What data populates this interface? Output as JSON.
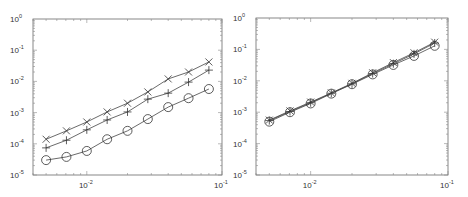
{
  "chart_data": [
    {
      "type": "line",
      "title": "",
      "xlabel": "",
      "ylabel": "",
      "xscale": "log",
      "yscale": "log",
      "xlim": [
        0.004,
        0.1
      ],
      "ylim": [
        1e-05,
        1
      ],
      "grid": false,
      "legend": null,
      "x_ticks": [
        {
          "base": "10",
          "exp": "-2",
          "value": 0.01
        },
        {
          "base": "10",
          "exp": "-1",
          "value": 0.1
        }
      ],
      "y_ticks": [
        {
          "base": "10",
          "exp": "0",
          "value": 1
        },
        {
          "base": "10",
          "exp": "-1",
          "value": 0.1
        },
        {
          "base": "10",
          "exp": "-2",
          "value": 0.01
        },
        {
          "base": "10",
          "exp": "-3",
          "value": 0.001
        },
        {
          "base": "10",
          "exp": "-4",
          "value": 0.0001
        },
        {
          "base": "10",
          "exp": "-5",
          "value": 1e-05
        }
      ],
      "x": [
        0.005,
        0.00707,
        0.01,
        0.01414,
        0.02,
        0.02828,
        0.04,
        0.05657,
        0.08
      ],
      "series": [
        {
          "name": "x-marker",
          "marker": "x",
          "values": [
            0.00014,
            0.00026,
            0.0005,
            0.00105,
            0.002,
            0.0046,
            0.012,
            0.02,
            0.042
          ]
        },
        {
          "name": "plus-marker",
          "marker": "+",
          "values": [
            7.4e-05,
            0.00013,
            0.00028,
            0.00058,
            0.00105,
            0.0027,
            0.0042,
            0.0095,
            0.023
          ]
        },
        {
          "name": "circle-marker",
          "marker": "o",
          "values": [
            3e-05,
            3.8e-05,
            5.9e-05,
            0.00014,
            0.00026,
            0.00062,
            0.0015,
            0.0029,
            0.0057
          ]
        }
      ]
    },
    {
      "type": "line",
      "title": "",
      "xlabel": "",
      "ylabel": "",
      "xscale": "log",
      "yscale": "log",
      "xlim": [
        0.004,
        0.1
      ],
      "ylim": [
        1e-05,
        1
      ],
      "grid": false,
      "legend": null,
      "x_ticks": [
        {
          "base": "10",
          "exp": "-2",
          "value": 0.01
        },
        {
          "base": "10",
          "exp": "-1",
          "value": 0.1
        }
      ],
      "y_ticks": [
        {
          "base": "10",
          "exp": "0",
          "value": 1
        },
        {
          "base": "10",
          "exp": "-1",
          "value": 0.1
        },
        {
          "base": "10",
          "exp": "-2",
          "value": 0.01
        },
        {
          "base": "10",
          "exp": "-3",
          "value": 0.001
        },
        {
          "base": "10",
          "exp": "-4",
          "value": 0.0001
        },
        {
          "base": "10",
          "exp": "-5",
          "value": 1e-05
        }
      ],
      "x": [
        0.005,
        0.00707,
        0.01,
        0.01414,
        0.02,
        0.02828,
        0.04,
        0.05657,
        0.08
      ],
      "series": [
        {
          "name": "x-marker",
          "marker": "x",
          "values": [
            0.00056,
            0.0011,
            0.0021,
            0.0041,
            0.0083,
            0.018,
            0.038,
            0.078,
            0.17
          ]
        },
        {
          "name": "plus-marker",
          "marker": "+",
          "values": [
            0.00054,
            0.00105,
            0.002,
            0.004,
            0.008,
            0.017,
            0.035,
            0.072,
            0.16
          ]
        },
        {
          "name": "circle-marker",
          "marker": "o",
          "values": [
            0.0005,
            0.001,
            0.0019,
            0.0039,
            0.0078,
            0.016,
            0.032,
            0.062,
            0.13
          ]
        }
      ]
    }
  ]
}
